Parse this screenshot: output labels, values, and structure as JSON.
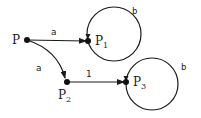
{
  "diagram": {
    "type": "state-transition-graph",
    "nodes": [
      {
        "id": "P",
        "label": "P",
        "sub": ""
      },
      {
        "id": "P1",
        "label": "P",
        "sub": "1"
      },
      {
        "id": "P2",
        "label": "P",
        "sub": "2"
      },
      {
        "id": "P3",
        "label": "P",
        "sub": "3"
      }
    ],
    "edges": [
      {
        "from": "P",
        "to": "P1",
        "label": "a"
      },
      {
        "from": "P",
        "to": "P2",
        "label": "a"
      },
      {
        "from": "P2",
        "to": "P3",
        "label": "1"
      },
      {
        "from": "P1",
        "to": "P1",
        "label": "b",
        "kind": "self-loop"
      },
      {
        "from": "P3",
        "to": "P3",
        "label": "b",
        "kind": "self-loop"
      }
    ]
  }
}
